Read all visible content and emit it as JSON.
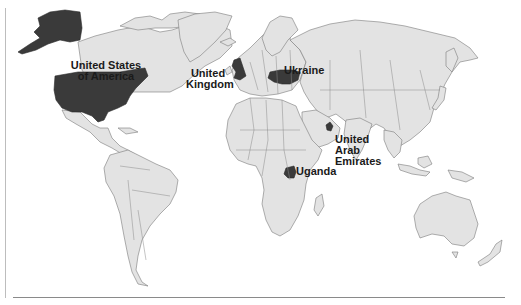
{
  "map": {
    "type": "world-choropleth",
    "highlight_color": "#3a3a3a",
    "land_color": "#e3e3e3",
    "border_color": "#7a7a7a",
    "background": "#ffffff",
    "highlighted_countries": [
      {
        "name": "United States of America",
        "label_lines": [
          "United States",
          "of America"
        ]
      },
      {
        "name": "United Kingdom",
        "label_lines": [
          "United",
          "Kingdom"
        ]
      },
      {
        "name": "Ukraine",
        "label_lines": [
          "Ukraine"
        ]
      },
      {
        "name": "United Arab Emirates",
        "label_lines": [
          "United",
          "Arab",
          "Emirates"
        ]
      },
      {
        "name": "Uganda",
        "label_lines": [
          "Uganda"
        ]
      }
    ]
  }
}
